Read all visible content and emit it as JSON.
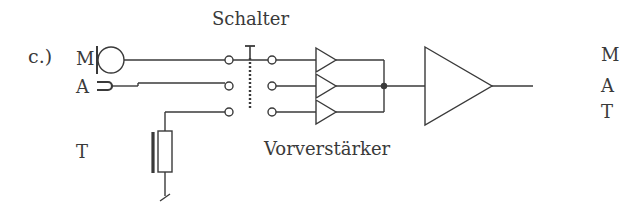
{
  "figure": {
    "part_label": "c.)",
    "switch_label": "Schalter",
    "preamp_label": "Vorverstärker",
    "inputs": [
      {
        "label": "M",
        "component": "microphone"
      },
      {
        "label": "A",
        "component": "pickup-jack"
      },
      {
        "label": "T",
        "component": "tape-head"
      }
    ],
    "outputs": [
      {
        "label": "M"
      },
      {
        "label": "A"
      },
      {
        "label": "T"
      }
    ],
    "colors": {
      "line": "#3a3a3a",
      "background": "#ffffff"
    }
  }
}
